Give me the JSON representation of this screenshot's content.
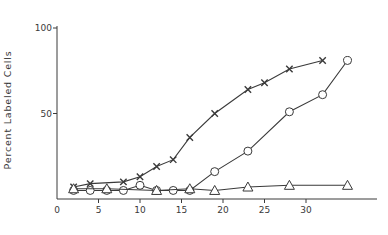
{
  "chart_data": {
    "type": "line",
    "title": "",
    "xlabel": "",
    "ylabel": "Percent Labeled Cells",
    "xlim": [
      0,
      38
    ],
    "ylim": [
      0,
      100
    ],
    "x_ticks": [
      0,
      5,
      10,
      15,
      20,
      25,
      30
    ],
    "y_ticks": [
      50,
      100
    ],
    "grid": false,
    "legend": null,
    "series": [
      {
        "name": "crosses",
        "marker": "x",
        "x": [
          2,
          4,
          8,
          10,
          12,
          14,
          16,
          19,
          23,
          25,
          28,
          32
        ],
        "y": [
          7,
          9,
          10,
          13,
          19,
          23,
          36,
          50,
          64,
          68,
          76,
          81
        ]
      },
      {
        "name": "circles",
        "marker": "o",
        "x": [
          2,
          4,
          6,
          8,
          10,
          12,
          14,
          16,
          19,
          23,
          28,
          32,
          35
        ],
        "y": [
          5,
          5,
          5,
          5,
          8,
          5,
          5,
          5,
          16,
          28,
          51,
          61,
          81
        ]
      },
      {
        "name": "triangles",
        "marker": "^",
        "x": [
          2,
          6,
          12,
          16,
          19,
          23,
          28,
          35
        ],
        "y": [
          6,
          6,
          5,
          6,
          5,
          7,
          8,
          8
        ]
      }
    ]
  },
  "axes": {
    "ylabel": "Percent Labeled Cells",
    "x_tick_labels": [
      "0",
      "5",
      "10",
      "15",
      "20",
      "25",
      "30"
    ],
    "y_tick_labels": [
      "50",
      "100"
    ]
  },
  "colors": {
    "ink": "#3a3a3a",
    "background": "#ffffff"
  }
}
